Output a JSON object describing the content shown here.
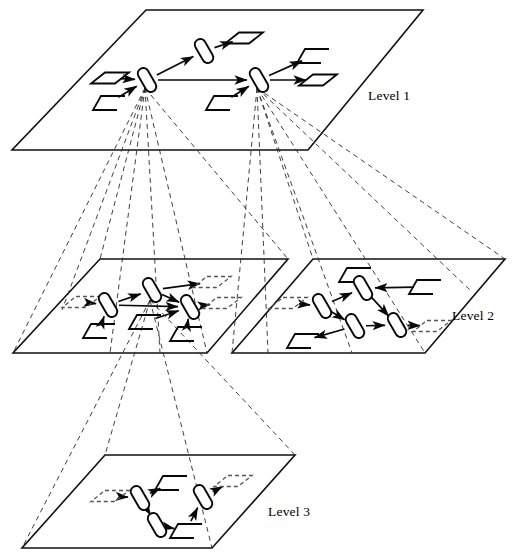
{
  "figure": {
    "background_color": "#ffffff",
    "line_color": "#080808",
    "ghost_color": "#555555",
    "projection_style": "dashed"
  },
  "labels": {
    "level1": "Level 1",
    "level2": "Level 2",
    "level3": "Level 3"
  },
  "label_positions": {
    "level1": {
      "x": 368,
      "y": 100
    },
    "level2": {
      "x": 452,
      "y": 320
    },
    "level3": {
      "x": 268,
      "y": 516
    }
  },
  "planes": [
    {
      "name": "level-1-plane",
      "label_key": "level1",
      "corners": [
        [
          146,
          10
        ],
        [
          423,
          10
        ],
        [
          308,
          150
        ],
        [
          12,
          150
        ]
      ]
    },
    {
      "name": "level-2-left-plane",
      "label_key": null,
      "corners": [
        [
          100,
          259
        ],
        [
          288,
          259
        ],
        [
          207,
          353
        ],
        [
          13,
          353
        ]
      ]
    },
    {
      "name": "level-2-right-plane",
      "label_key": "level2",
      "corners": [
        [
          313,
          259
        ],
        [
          505,
          259
        ],
        [
          425,
          353
        ],
        [
          232,
          353
        ]
      ]
    },
    {
      "name": "level-3-plane",
      "label_key": "level3",
      "corners": [
        [
          105,
          455
        ],
        [
          295,
          455
        ],
        [
          212,
          548
        ],
        [
          22,
          548
        ]
      ]
    }
  ],
  "level1_nodes": [
    {
      "id": "L1-N1",
      "x": 147,
      "y": 80,
      "type": "process"
    },
    {
      "id": "L1-N2",
      "x": 204,
      "y": 51,
      "type": "process"
    },
    {
      "id": "L1-N3",
      "x": 259,
      "y": 80,
      "type": "process"
    }
  ],
  "level1_io": [
    {
      "id": "L1-IN1",
      "x": 110,
      "y": 78,
      "type": "parallelogram",
      "ghost": false
    },
    {
      "id": "L1-IN2",
      "x": 109,
      "y": 103,
      "type": "flag",
      "ghost": false
    },
    {
      "id": "L1-OUT1",
      "x": 244,
      "y": 38,
      "type": "parallelogram",
      "ghost": false
    },
    {
      "id": "L1-IN3",
      "x": 222,
      "y": 103,
      "type": "flag",
      "ghost": false
    },
    {
      "id": "L1-OUT2",
      "x": 313,
      "y": 56,
      "type": "flag",
      "ghost": false
    },
    {
      "id": "L1-OUT3",
      "x": 318,
      "y": 80,
      "type": "parallelogram",
      "ghost": false
    }
  ],
  "level1_edges": [
    {
      "from": "L1-IN1",
      "to": "L1-N1",
      "arrow": true
    },
    {
      "from": "L1-IN2",
      "to": "L1-N1",
      "arrow": true
    },
    {
      "from": "L1-N1",
      "to": "L1-N2",
      "arrow": true
    },
    {
      "from": "L1-N1",
      "to": "L1-N3",
      "arrow": true
    },
    {
      "from": "L1-N2",
      "to": "L1-OUT1",
      "arrow": true
    },
    {
      "from": "L1-IN3",
      "to": "L1-N3",
      "arrow": true
    },
    {
      "from": "L1-N3",
      "to": "L1-OUT2",
      "arrow": true
    },
    {
      "from": "L1-N3",
      "to": "L1-OUT3",
      "arrow": true
    }
  ],
  "level2_left_nodes": [
    {
      "id": "L2L-N1",
      "x": 108,
      "y": 305,
      "type": "process"
    },
    {
      "id": "L2L-N2",
      "x": 152,
      "y": 290,
      "type": "process"
    },
    {
      "id": "L2L-N3",
      "x": 190,
      "y": 307,
      "type": "process"
    }
  ],
  "level2_left_io": [
    {
      "id": "L2L-IN1",
      "x": 81,
      "y": 302,
      "type": "parallelogram",
      "ghost": true
    },
    {
      "id": "L2L-IN2",
      "x": 99,
      "y": 331,
      "type": "flag",
      "ghost": false
    },
    {
      "id": "L2L-IN3",
      "x": 145,
      "y": 322,
      "type": "flag",
      "ghost": false
    },
    {
      "id": "L2L-IN4",
      "x": 186,
      "y": 334,
      "type": "flag",
      "ghost": false
    },
    {
      "id": "L2L-OUT1",
      "x": 212,
      "y": 282,
      "type": "parallelogram",
      "ghost": true
    },
    {
      "id": "L2L-OUT2",
      "x": 222,
      "y": 303,
      "type": "parallelogram",
      "ghost": true
    }
  ],
  "level2_left_edges": [
    {
      "from": "L2L-IN1",
      "to": "L2L-N1",
      "arrow": true
    },
    {
      "from": "L2L-IN2",
      "to": "L2L-N1",
      "arrow": true
    },
    {
      "from": "L2L-N1",
      "to": "L2L-N2",
      "arrow": true
    },
    {
      "from": "L2L-N1",
      "to": "L2L-N3",
      "arrow": true
    },
    {
      "from": "L2L-N2",
      "to": "L2L-OUT1",
      "arrow": true
    },
    {
      "from": "L2L-N2",
      "to": "L2L-N3",
      "arrow": true
    },
    {
      "from": "L2L-IN3",
      "to": "L2L-N3",
      "arrow": true
    },
    {
      "from": "L2L-IN4",
      "to": "L2L-N3",
      "arrow": true
    },
    {
      "from": "L2L-N3",
      "to": "L2L-OUT2",
      "arrow": true
    }
  ],
  "level2_right_nodes": [
    {
      "id": "L2R-N1",
      "x": 322,
      "y": 306,
      "type": "process"
    },
    {
      "id": "L2R-N2",
      "x": 363,
      "y": 288,
      "type": "process"
    },
    {
      "id": "L2R-N3",
      "x": 355,
      "y": 326,
      "type": "process"
    },
    {
      "id": "L2R-N4",
      "x": 397,
      "y": 325,
      "type": "process"
    }
  ],
  "level2_right_io": [
    {
      "id": "L2R-IN1",
      "x": 288,
      "y": 303,
      "type": "parallelogram",
      "ghost": true
    },
    {
      "id": "L2R-IN2",
      "x": 355,
      "y": 275,
      "type": "flag",
      "ghost": false
    },
    {
      "id": "L2R-OUT1",
      "x": 425,
      "y": 287,
      "type": "flag",
      "ghost": false
    },
    {
      "id": "L2R-OUT2",
      "x": 303,
      "y": 341,
      "type": "flag",
      "ghost": false
    },
    {
      "id": "L2R-OUT3",
      "x": 432,
      "y": 326,
      "type": "parallelogram",
      "ghost": true
    }
  ],
  "level2_right_edges": [
    {
      "from": "L2R-IN1",
      "to": "L2R-N1",
      "arrow": true
    },
    {
      "from": "L2R-N1",
      "to": "L2R-N2",
      "arrow": true
    },
    {
      "from": "L2R-N1",
      "to": "L2R-N3",
      "arrow": true
    },
    {
      "from": "L2R-IN2",
      "to": "L2R-N2",
      "arrow": true
    },
    {
      "from": "L2R-OUT1",
      "to": "L2R-N2",
      "arrow": true
    },
    {
      "from": "L2R-N2",
      "to": "L2R-N4",
      "arrow": true
    },
    {
      "from": "L2R-N3",
      "to": "L2R-N4",
      "arrow": true
    },
    {
      "from": "L2R-N3",
      "to": "L2R-OUT2",
      "arrow": true
    },
    {
      "from": "L2R-N4",
      "to": "L2R-OUT3",
      "arrow": true
    }
  ],
  "level3_nodes": [
    {
      "id": "L3-N1",
      "x": 140,
      "y": 498,
      "type": "process"
    },
    {
      "id": "L3-N2",
      "x": 157,
      "y": 525,
      "type": "process"
    },
    {
      "id": "L3-N3",
      "x": 203,
      "y": 497,
      "type": "process"
    }
  ],
  "level3_io": [
    {
      "id": "L3-IN1",
      "x": 110,
      "y": 496,
      "type": "parallelogram",
      "ghost": true
    },
    {
      "id": "L3-OUT1",
      "x": 171,
      "y": 483,
      "type": "flag",
      "ghost": false
    },
    {
      "id": "L3-IN2",
      "x": 186,
      "y": 531,
      "type": "flag",
      "ghost": false
    },
    {
      "id": "L3-OUT2",
      "x": 233,
      "y": 481,
      "type": "parallelogram",
      "ghost": true
    }
  ],
  "level3_edges": [
    {
      "from": "L3-IN1",
      "to": "L3-N1",
      "arrow": true
    },
    {
      "from": "L3-N1",
      "to": "L3-OUT1",
      "arrow": true
    },
    {
      "from": "L3-N1",
      "to": "L3-N2",
      "arrow": true
    },
    {
      "from": "L3-N2",
      "to": "L3-IN2",
      "arrow": true
    },
    {
      "from": "L3-IN2",
      "to": "L3-N3",
      "arrow": true
    },
    {
      "from": "L3-N3",
      "to": "L3-OUT2",
      "arrow": true
    }
  ],
  "projection_fans": [
    {
      "name": "fan-from-L1-N1",
      "origin": [
        145,
        88
      ],
      "targets": [
        [
          13,
          353
        ],
        [
          100,
          259
        ],
        [
          207,
          353
        ],
        [
          288,
          259
        ],
        [
          110,
          353
        ],
        [
          160,
          353
        ],
        [
          62,
          310
        ]
      ]
    },
    {
      "name": "fan-from-L1-N3",
      "origin": [
        257,
        88
      ],
      "targets": [
        [
          232,
          353
        ],
        [
          313,
          259
        ],
        [
          425,
          353
        ],
        [
          505,
          259
        ],
        [
          268,
          353
        ],
        [
          352,
          353
        ],
        [
          470,
          290
        ]
      ]
    },
    {
      "name": "fan-from-L2-left-to-L3",
      "origin": [
        150,
        300
      ],
      "targets": [
        [
          22,
          548
        ],
        [
          105,
          455
        ],
        [
          212,
          548
        ],
        [
          295,
          455
        ]
      ]
    }
  ]
}
